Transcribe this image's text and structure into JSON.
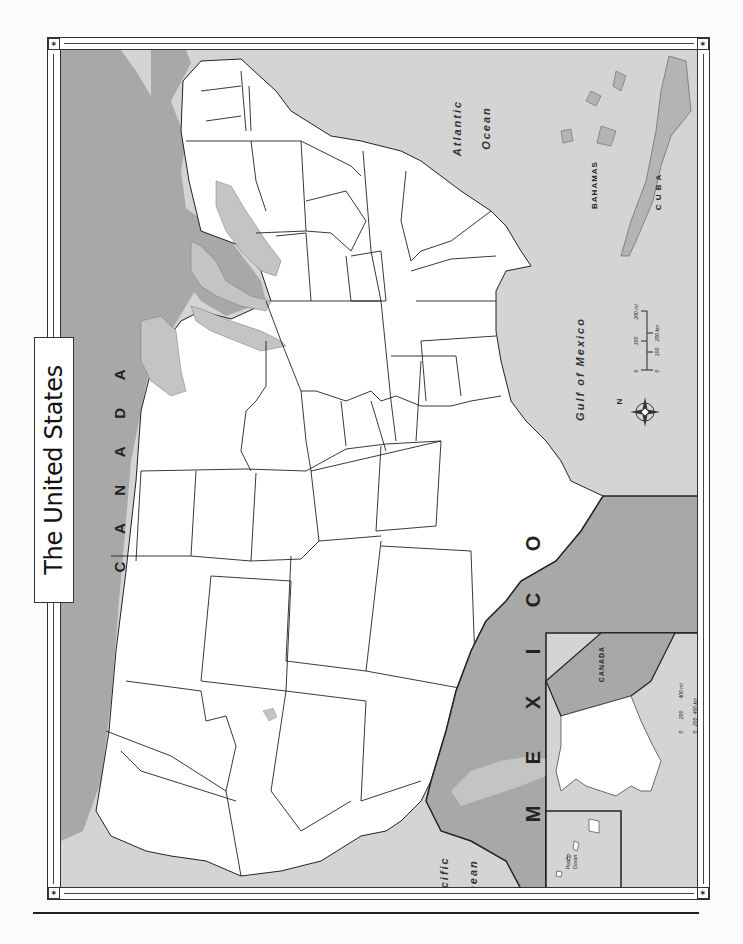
{
  "map": {
    "title": "The United States",
    "labels": {
      "canada": "C A N A D A",
      "mexico": "M E X I C O",
      "atlantic_line1": "Atlantic",
      "atlantic_line2": "Ocean",
      "pacific_line1": "Pacific",
      "pacific_line2": "Ocean",
      "gulf": "Gulf of Mexico",
      "bahamas": "BAHAMAS",
      "cuba": "C U B A",
      "compass_n": "N"
    },
    "scale_bar": {
      "miles": [
        "0",
        "100",
        "200 mi"
      ],
      "km": [
        "0",
        "100",
        "200 km"
      ]
    },
    "inset_alaska": {
      "canada_label": "CANADA",
      "scale_miles": [
        "0",
        "200",
        "400 mi"
      ],
      "scale_km": [
        "0",
        "200",
        "400 km"
      ]
    },
    "inset_hawaii": {
      "ocean_line1": "Pacific",
      "ocean_line2": "Ocean"
    },
    "colors": {
      "land_us": "#ffffff",
      "land_foreign": "#a9a9a9",
      "water": "#d2d2d2",
      "lakes": "#c4c4c4",
      "border": "#222222"
    },
    "orientation": "rotated 90° counter-clockwise (north points left)"
  }
}
